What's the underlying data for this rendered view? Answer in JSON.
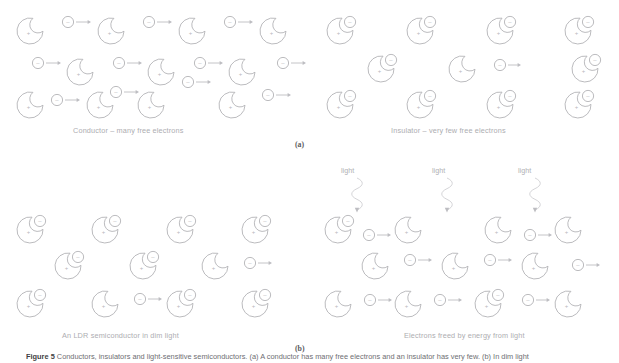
{
  "figure": {
    "caption_prefix": "Figure 5",
    "caption_text": "Conductors, insulators and light-sensitive semiconductors. (a) A conductor has many free electrons and an insulator has very few. (b) In dim light",
    "background_color": "#ffffff",
    "stroke_color": "#b3b3b7",
    "arrow_color": "#bdbdc1",
    "wave_color": "#cfcfd3",
    "text_color": "#adadb1"
  },
  "sub_labels": [
    {
      "name": "sub-label-a",
      "text": "(a)"
    },
    {
      "name": "sub-label-b",
      "text": "(b)"
    }
  ],
  "panels": [
    {
      "id": "conductor",
      "label": "Conductor – many free electrons",
      "description": "Lattice of positive ion cores with many free electrons drifting right"
    },
    {
      "id": "insulator",
      "label": "Insulator – very few free electrons",
      "description": "Positive ion cores with electrons bound into notches; one free electron"
    },
    {
      "id": "ldr-dim",
      "label": "An LDR semiconductor in dim light",
      "description": "Mostly bound electrons with two freed electrons drifting right"
    },
    {
      "id": "ldr-lit",
      "label": "Electrons freed by energy from light",
      "description": "Light waves strike the lattice freeing many electrons"
    }
  ],
  "light_labels": [
    {
      "name": "light-label-1",
      "text": "light"
    },
    {
      "name": "light-label-2",
      "text": "light"
    },
    {
      "name": "light-label-3",
      "text": "light"
    }
  ],
  "symbols": {
    "positive_core": "+",
    "electron": "–"
  },
  "chart_data": {
    "type": "diagram",
    "panel_grid": {
      "rows": 2,
      "cols": 2
    },
    "atoms": {
      "notched_atom_radius": 13,
      "electron_radius": 5.5,
      "notch_position": "upper-right"
    },
    "panel_contents": [
      {
        "panel": "conductor",
        "atoms_with_bound_electrons": 0,
        "free_electrons": 10,
        "ion_cores": 11
      },
      {
        "panel": "insulator",
        "atoms_with_bound_electrons": 11,
        "free_electrons": 1,
        "ion_cores": 12
      },
      {
        "panel": "ldr-dim",
        "atoms_with_bound_electrons": 9,
        "free_electrons": 2,
        "ion_cores": 11
      },
      {
        "panel": "ldr-lit",
        "atoms_with_bound_electrons": 1,
        "free_electrons": 9,
        "ion_cores": 12,
        "light_rays": 3
      }
    ]
  }
}
